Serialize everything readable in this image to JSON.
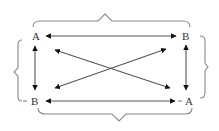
{
  "diagram": {
    "type": "square-of-opposition",
    "nodes": {
      "top_left": {
        "label": "A"
      },
      "top_right": {
        "label": "B"
      },
      "bottom_left": {
        "label": "B"
      },
      "bottom_right": {
        "label": "A"
      }
    },
    "edges": [
      {
        "from": "top_left",
        "to": "top_right",
        "style": "double-headed arrow",
        "orientation": "horizontal"
      },
      {
        "from": "bottom_left",
        "to": "bottom_right",
        "style": "double-headed arrow",
        "orientation": "horizontal"
      },
      {
        "from": "top_left",
        "to": "bottom_left",
        "style": "double-headed arrow",
        "orientation": "vertical"
      },
      {
        "from": "top_right",
        "to": "bottom_right",
        "style": "double-headed arrow",
        "orientation": "vertical"
      },
      {
        "from": "top_left",
        "to": "bottom_right",
        "style": "double-headed arrow",
        "orientation": "diagonal"
      },
      {
        "from": "top_right",
        "to": "bottom_left",
        "style": "double-headed arrow",
        "orientation": "diagonal"
      }
    ],
    "braces": [
      {
        "position": "top",
        "spans": [
          "top_left",
          "top_right"
        ]
      },
      {
        "position": "bottom",
        "spans": [
          "bottom_left",
          "bottom_right"
        ]
      },
      {
        "position": "left",
        "spans": [
          "top_left",
          "bottom_left"
        ]
      },
      {
        "position": "right",
        "spans": [
          "top_right",
          "bottom_right"
        ]
      }
    ],
    "colors": {
      "arrow": "#555555",
      "brace": "#8a8a8a",
      "label": "#333333",
      "background": "#ffffff"
    }
  }
}
